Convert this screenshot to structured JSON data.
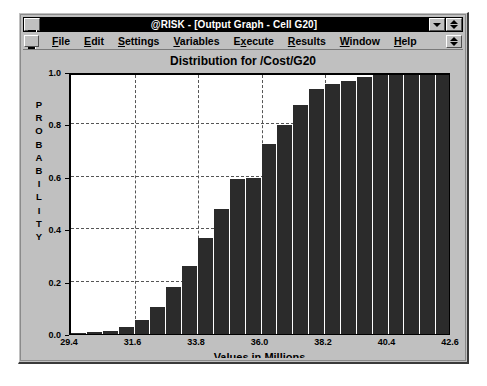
{
  "window": {
    "title": "@RISK - [Output Graph - Cell G20]",
    "system_menu_icon": "system-menu-icon",
    "minimize_icon": "minimize-icon",
    "restore_icon": "restore-icon",
    "document_system_menu_icon": "document-system-menu-icon",
    "document_restore_icon": "document-restore-icon"
  },
  "menu": {
    "items": [
      {
        "label": "File",
        "accel": "F"
      },
      {
        "label": "Edit",
        "accel": "E"
      },
      {
        "label": "Settings",
        "accel": "S"
      },
      {
        "label": "Variables",
        "accel": "V"
      },
      {
        "label": "Execute",
        "accel": "x"
      },
      {
        "label": "Results",
        "accel": "R"
      },
      {
        "label": "Window",
        "accel": "W"
      },
      {
        "label": "Help",
        "accel": "H"
      }
    ]
  },
  "chart_data": {
    "type": "bar",
    "title": "Distribution for /Cost/G20",
    "xlabel": "Values in Millions",
    "ylabel": "PROBABILITY",
    "ylabel_letters": [
      "P",
      "R",
      "O",
      "B",
      "A",
      "B",
      "I",
      "L",
      "I",
      "T",
      "Y"
    ],
    "xlim": [
      29.4,
      42.6
    ],
    "ylim": [
      0.0,
      1.0
    ],
    "grid": true,
    "legend": false,
    "xticks": [
      29.4,
      31.6,
      33.8,
      36.0,
      38.2,
      40.4,
      42.6
    ],
    "xtick_labels": [
      "29.4",
      "31.6",
      "33.8",
      "36.0",
      "38.2",
      "40.4",
      "42.6"
    ],
    "yticks": [
      0.0,
      0.2,
      0.4,
      0.6,
      0.8,
      1.0
    ],
    "ytick_labels": [
      "0.0",
      "0.2",
      "0.4",
      "0.6",
      "0.8",
      "1.0"
    ],
    "bin_width": 0.55,
    "x": [
      29.675,
      30.225,
      30.775,
      31.325,
      31.875,
      32.425,
      32.975,
      33.525,
      34.075,
      34.625,
      35.175,
      35.725,
      36.275,
      36.825,
      37.375,
      37.925,
      38.475,
      39.025,
      39.575,
      40.125,
      40.675,
      41.225,
      41.775,
      42.325
    ],
    "values": [
      0.003,
      0.006,
      0.012,
      0.028,
      0.055,
      0.105,
      0.178,
      0.258,
      0.368,
      0.478,
      0.592,
      0.596,
      0.727,
      0.797,
      0.873,
      0.936,
      0.956,
      0.967,
      0.981,
      0.988,
      0.995,
      0.998,
      0.999,
      1.0
    ]
  }
}
